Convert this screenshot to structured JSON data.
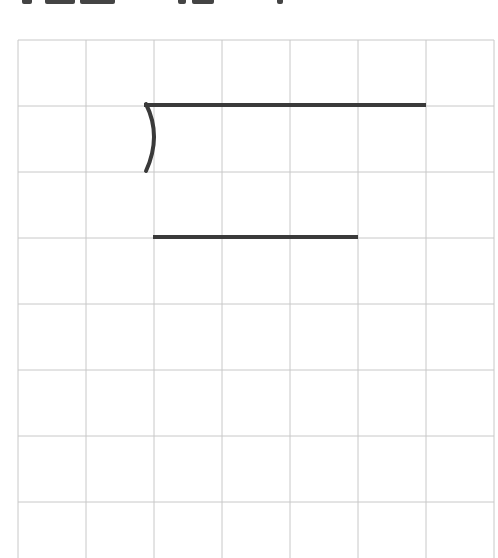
{
  "grid": {
    "left": 18,
    "top": 40,
    "cols": 7,
    "rows": 8,
    "cell_w": 68,
    "cell_h": 66,
    "line_color": "#c8c8c8",
    "stroke_color": "#3a3a3a"
  },
  "strokes": [
    {
      "type": "arc-hook",
      "description": "curved stroke opening right, at top of cell row 2 col 3"
    },
    {
      "type": "horizontal",
      "description": "long horizontal at row line 2 from col 3 to col 7"
    },
    {
      "type": "horizontal",
      "description": "horizontal at row line 4 from col 3 to col 6"
    }
  ]
}
